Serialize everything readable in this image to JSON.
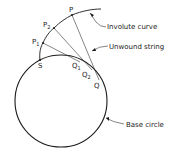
{
  "diagram": {
    "labels": {
      "involute": "Involute curve",
      "string": "Unwound string",
      "base": "Base circle"
    },
    "points": {
      "P": "P",
      "P2": "P",
      "P2_sub": "2",
      "P1": "P",
      "P1_sub": "1",
      "S": "S",
      "Q1": "Q",
      "Q1_sub": "1",
      "Q2": "Q",
      "Q2_sub": "2",
      "Q": "Q"
    },
    "colors": {
      "stroke": "#1a1a1a",
      "background": "#ffffff"
    }
  }
}
